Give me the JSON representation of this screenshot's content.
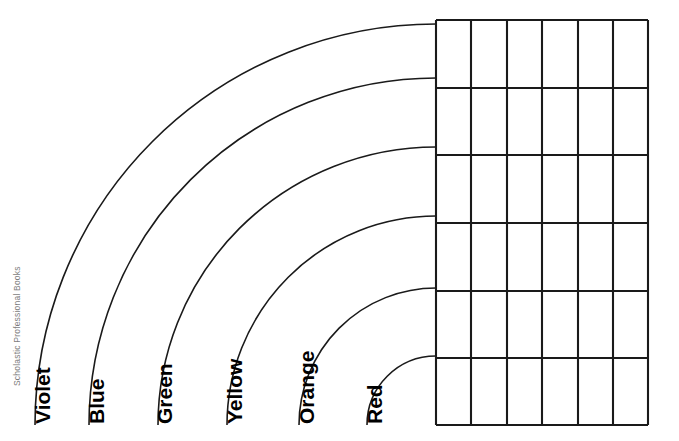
{
  "page": {
    "width": 679,
    "height": 441,
    "background_color": "#ffffff",
    "ink_color": "#1a1a1a"
  },
  "credit": {
    "text": "Scholastic Professional Books",
    "color": "#7d7d7d",
    "rotation": "-90deg"
  },
  "rainbow": {
    "center_x": 436,
    "center_y": 425,
    "bands": [
      {
        "label": "Violet",
        "index": 0,
        "radius": 401,
        "label_x": 50,
        "label_y": 424
      },
      {
        "label": "Blue",
        "index": 1,
        "radius": 347,
        "label_x": 104,
        "label_y": 424
      },
      {
        "label": "Green",
        "index": 2,
        "radius": 278,
        "label_x": 172,
        "label_y": 424
      },
      {
        "label": "Yellow",
        "index": 3,
        "radius": 209,
        "label_x": 242,
        "label_y": 424
      },
      {
        "label": "Orange",
        "index": 4,
        "radius": 137,
        "label_x": 314,
        "label_y": 424
      },
      {
        "label": "Red",
        "index": 5,
        "radius": 69,
        "label_x": 382,
        "label_y": 424
      }
    ]
  },
  "grid": {
    "left": 436,
    "top": 20,
    "right": 648,
    "bottom": 425,
    "columns": 6,
    "rows": 6,
    "column_x": [
      436,
      471,
      507,
      542,
      578,
      613,
      648
    ],
    "row_y": [
      20,
      88,
      155,
      223,
      291,
      358,
      425
    ],
    "cells": [
      [
        "",
        "",
        "",
        "",
        "",
        ""
      ],
      [
        "",
        "",
        "",
        "",
        "",
        ""
      ],
      [
        "",
        "",
        "",
        "",
        "",
        ""
      ],
      [
        "",
        "",
        "",
        "",
        "",
        ""
      ],
      [
        "",
        "",
        "",
        "",
        "",
        ""
      ],
      [
        "",
        "",
        "",
        "",
        "",
        ""
      ]
    ]
  }
}
